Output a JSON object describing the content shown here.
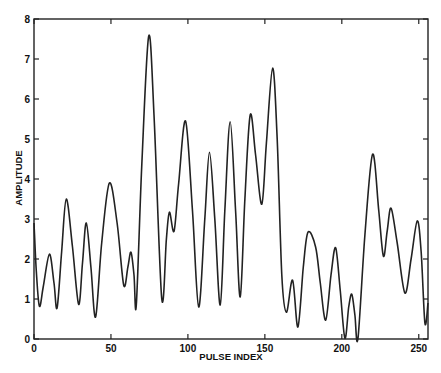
{
  "chart_data": {
    "type": "line",
    "title": "",
    "xlabel": "PULSE INDEX",
    "ylabel": "AMPLITUDE",
    "xlim": [
      0,
      256
    ],
    "ylim": [
      0,
      8
    ],
    "xticks": [
      0,
      50,
      100,
      150,
      200,
      250
    ],
    "yticks": [
      0,
      1,
      2,
      3,
      4,
      5,
      6,
      7,
      8
    ],
    "grid": false,
    "legend": null,
    "line_color": "#222222",
    "series": [
      {
        "name": "amplitude",
        "x": [
          0,
          1.5,
          3.5,
          6,
          10,
          13,
          15,
          18,
          21,
          25,
          29,
          31.5,
          34,
          37,
          40,
          44,
          49,
          54,
          58.3,
          61,
          63,
          65,
          66.5,
          70,
          74.5,
          78,
          83,
          86,
          88,
          91,
          94,
          98.5,
          103,
          107,
          111,
          114,
          117.5,
          121,
          124,
          127.5,
          131,
          134,
          137,
          140.5,
          144,
          148,
          151,
          155,
          158,
          161,
          164,
          168,
          171.5,
          175,
          178,
          183,
          186,
          189.5,
          193,
          196,
          199,
          202,
          204.5,
          206.5,
          208.5,
          210.5,
          215,
          220,
          224,
          227,
          229.5,
          232,
          236,
          241,
          245,
          249,
          251.5,
          254,
          256
        ],
        "y": [
          2.9,
          1.7,
          0.82,
          1.3,
          2.12,
          1.4,
          0.78,
          2.2,
          3.5,
          2.3,
          0.87,
          1.9,
          2.9,
          1.8,
          0.55,
          2.4,
          3.9,
          2.9,
          1.35,
          1.8,
          2.17,
          1.6,
          0.85,
          4.3,
          7.57,
          5.6,
          1.02,
          2.5,
          3.17,
          2.7,
          3.9,
          5.45,
          3.2,
          0.8,
          3.0,
          4.67,
          3.0,
          0.85,
          3.2,
          5.43,
          3.2,
          1.05,
          3.5,
          5.6,
          4.6,
          3.37,
          4.9,
          6.77,
          5.0,
          1.6,
          0.67,
          1.47,
          0.3,
          1.8,
          2.67,
          2.3,
          1.4,
          0.47,
          1.6,
          2.28,
          1.2,
          0.02,
          0.8,
          1.12,
          0.6,
          0.02,
          2.6,
          4.62,
          3.2,
          2.07,
          2.7,
          3.27,
          2.4,
          1.15,
          2.0,
          2.95,
          2.2,
          0.4,
          0.9
        ]
      }
    ]
  }
}
